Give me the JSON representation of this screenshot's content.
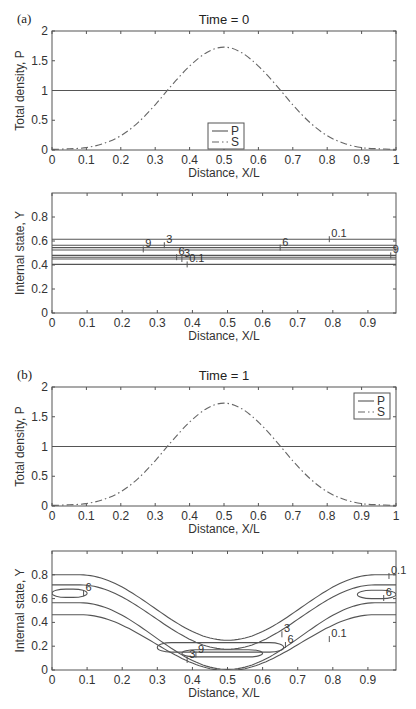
{
  "chart_data": [
    {
      "id": "a-top",
      "panel": "(a)",
      "type": "line",
      "title": "Time = 0",
      "xlabel": "Distance, X/L",
      "ylabel": "Total density, P",
      "xlim": [
        0,
        1
      ],
      "ylim": [
        0,
        2
      ],
      "xticks": [
        "0",
        "0.1",
        "0.2",
        "0.3",
        "0.4",
        "0.5",
        "0.6",
        "0.7",
        "0.8",
        "0.9",
        "1"
      ],
      "yticks": [
        "0",
        "0.5",
        "1",
        "1.5",
        "2"
      ],
      "legend": {
        "entries": [
          "P",
          "S"
        ],
        "placement": "bottom-center"
      },
      "series": [
        {
          "name": "P",
          "style": "solid",
          "x": [
            0,
            1
          ],
          "y": [
            1,
            1
          ]
        },
        {
          "name": "S",
          "style": "dash-dot",
          "x": [
            0,
            0.05,
            0.1,
            0.15,
            0.2,
            0.25,
            0.3,
            0.35,
            0.4,
            0.45,
            0.5,
            0.55,
            0.6,
            0.65,
            0.7,
            0.75,
            0.8,
            0.85,
            0.9,
            0.95,
            1
          ],
          "y": [
            0.01,
            0.02,
            0.04,
            0.11,
            0.24,
            0.46,
            0.76,
            1.1,
            1.41,
            1.64,
            1.73,
            1.64,
            1.41,
            1.1,
            0.76,
            0.46,
            0.24,
            0.11,
            0.04,
            0.02,
            0.01
          ]
        }
      ]
    },
    {
      "id": "a-bottom",
      "type": "contour",
      "title": "",
      "xlabel": "Distance, X/L",
      "ylabel": "Internal state, Y",
      "xlim": [
        0,
        0.98
      ],
      "ylim": [
        0,
        1
      ],
      "xticks": [
        "0",
        "0.1",
        "0.2",
        "0.3",
        "0.4",
        "0.5",
        "0.6",
        "0.7",
        "0.8",
        "0.9"
      ],
      "yticks": [
        "0",
        "0.2",
        "0.4",
        "0.6",
        "0.8"
      ],
      "contours": [
        {
          "level": "0.1",
          "y": 0.615
        },
        {
          "level": "3",
          "y": 0.565
        },
        {
          "level": "6",
          "y": 0.545
        },
        {
          "level": "9",
          "y": 0.525
        },
        {
          "level": "9",
          "y": 0.48
        },
        {
          "level": "6",
          "y": 0.465
        },
        {
          "level": "3",
          "y": 0.45
        },
        {
          "level": "0.1",
          "y": 0.405
        }
      ],
      "contour_labels": [
        {
          "text": "9",
          "x": 0.26,
          "y": 0.53
        },
        {
          "text": "3",
          "x": 0.32,
          "y": 0.565
        },
        {
          "text": "6",
          "x": 0.65,
          "y": 0.545
        },
        {
          "text": "0.1",
          "x": 0.79,
          "y": 0.615
        },
        {
          "text": "6",
          "x": 0.355,
          "y": 0.465
        },
        {
          "text": "3",
          "x": 0.37,
          "y": 0.45
        },
        {
          "text": "0.1",
          "x": 0.385,
          "y": 0.405
        },
        {
          "text": "9",
          "x": 0.965,
          "y": 0.48
        }
      ]
    },
    {
      "id": "b-top",
      "panel": "(b)",
      "type": "line",
      "title": "Time = 1",
      "xlabel": "Distance, X/L",
      "ylabel": "Total density, P",
      "xlim": [
        0,
        1
      ],
      "ylim": [
        0,
        2
      ],
      "xticks": [
        "0",
        "0.1",
        "0.2",
        "0.3",
        "0.4",
        "0.5",
        "0.6",
        "0.7",
        "0.8",
        "0.9",
        "1"
      ],
      "yticks": [
        "0",
        "0.5",
        "1",
        "1.5",
        "2"
      ],
      "legend": {
        "entries": [
          "P",
          "S"
        ],
        "placement": "top-right"
      },
      "series": [
        {
          "name": "P",
          "style": "solid",
          "x": [
            0,
            1
          ],
          "y": [
            1,
            1
          ]
        },
        {
          "name": "S",
          "style": "dash-dot",
          "x": [
            0,
            0.05,
            0.1,
            0.15,
            0.2,
            0.25,
            0.3,
            0.35,
            0.4,
            0.45,
            0.5,
            0.55,
            0.6,
            0.65,
            0.7,
            0.75,
            0.8,
            0.85,
            0.9,
            0.95,
            1
          ],
          "y": [
            0.01,
            0.02,
            0.04,
            0.11,
            0.24,
            0.46,
            0.76,
            1.1,
            1.41,
            1.64,
            1.73,
            1.64,
            1.41,
            1.1,
            0.76,
            0.46,
            0.24,
            0.11,
            0.04,
            0.02,
            0.01
          ]
        }
      ]
    },
    {
      "id": "b-bottom",
      "type": "contour",
      "title": "",
      "xlabel": "Distance, X/L",
      "ylabel": "Internal state, Y",
      "xlim": [
        0,
        0.98
      ],
      "ylim": [
        0,
        1
      ],
      "xticks": [
        "0",
        "0.1",
        "0.2",
        "0.3",
        "0.4",
        "0.5",
        "0.6",
        "0.7",
        "0.8",
        "0.9"
      ],
      "yticks": [
        "0",
        "0.2",
        "0.4",
        "0.6",
        "0.8"
      ],
      "open_contours": [
        {
          "level": "0.1",
          "offset": 0.8,
          "depth": 0.55
        },
        {
          "level": "3",
          "offset": 0.715,
          "depth": 0.54
        },
        {
          "level": "3",
          "offset": 0.565,
          "depth": 0.56
        },
        {
          "level": "0.1",
          "offset": 0.465,
          "depth": 0.47
        }
      ],
      "closed_contours": [
        {
          "level": "6",
          "x": [
            0,
            0.1
          ],
          "y": [
            0.61,
            0.68
          ]
        },
        {
          "level": "6",
          "x": [
            0.87,
            0.98
          ],
          "y": [
            0.6,
            0.67
          ]
        },
        {
          "level": "6",
          "x": [
            0.3,
            0.66
          ],
          "y": [
            0.15,
            0.23
          ]
        },
        {
          "level": "9",
          "x": [
            0.37,
            0.6
          ],
          "y": [
            0.11,
            0.17
          ]
        }
      ],
      "contour_labels": [
        {
          "text": "6",
          "x": 0.09,
          "y": 0.645
        },
        {
          "text": "0.1",
          "x": 0.96,
          "y": 0.79
        },
        {
          "text": "6",
          "x": 0.945,
          "y": 0.605
        },
        {
          "text": "3",
          "x": 0.655,
          "y": 0.3
        },
        {
          "text": "6",
          "x": 0.665,
          "y": 0.21
        },
        {
          "text": "0.1",
          "x": 0.79,
          "y": 0.26
        },
        {
          "text": "9",
          "x": 0.41,
          "y": 0.13
        },
        {
          "text": "3",
          "x": 0.385,
          "y": 0.085
        }
      ]
    }
  ]
}
